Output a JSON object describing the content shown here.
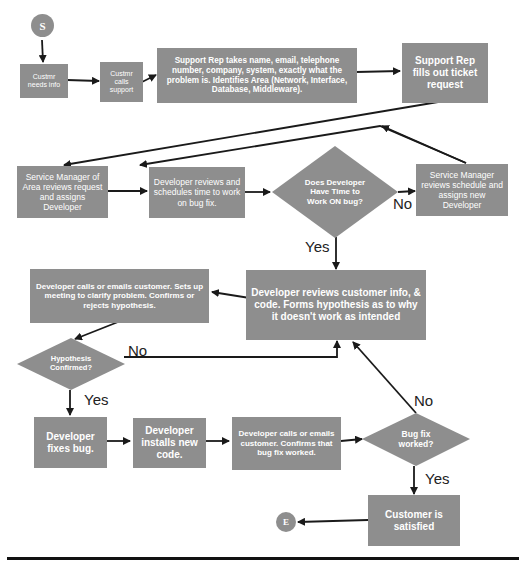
{
  "diagram": {
    "type": "flowchart",
    "colors": {
      "node_fill": "#8e8e8e",
      "node_text": "#ffffff",
      "connector": "#1a1a1a",
      "label": "#222222"
    },
    "start": {
      "label": "S"
    },
    "end": {
      "label": "E"
    },
    "nodes": {
      "customer_needs_info": "Custmr needs info",
      "customer_calls_support": "Custmr calls support",
      "support_rep_takes_info": "Support Rep takes name, email, telephone number, company, system, exactly what the problem is. Identifies Area (Network, Interface, Database, Middleware).",
      "support_rep_ticket": "Support Rep fills out ticket request",
      "service_manager_area": "Service Manager of Area reviews request and assigns Developer",
      "developer_schedules": "Developer reviews and schedules time to work on bug fix.",
      "developer_has_time": "Does Developer Have Time to Work ON bug?",
      "service_manager_reassign": "Service Manager reviews schedule and assigns new Developer",
      "developer_reviews_info": "Developer reviews customer info, & code. Forms hypothesis as to why it doesn't work as intended",
      "developer_contacts_customer": "Developer calls or emails customer. Sets up meeting to clarify problem. Confirms or rejects hypothesis.",
      "hypothesis_confirmed": "Hypothesis Confirmed?",
      "developer_fixes_bug": "Developer fixes bug.",
      "developer_installs_code": "Developer installs new code.",
      "developer_confirms_fix": "Developer calls or emails customer. Confirms that bug fix worked.",
      "bug_fix_worked": "Bug fix worked?",
      "customer_satisfied": "Customer is satisfied"
    },
    "edge_labels": {
      "has_time_no": "No",
      "has_time_yes": "Yes",
      "hypothesis_no": "No",
      "hypothesis_yes": "Yes",
      "bug_fix_no": "No",
      "bug_fix_yes": "Yes"
    }
  }
}
